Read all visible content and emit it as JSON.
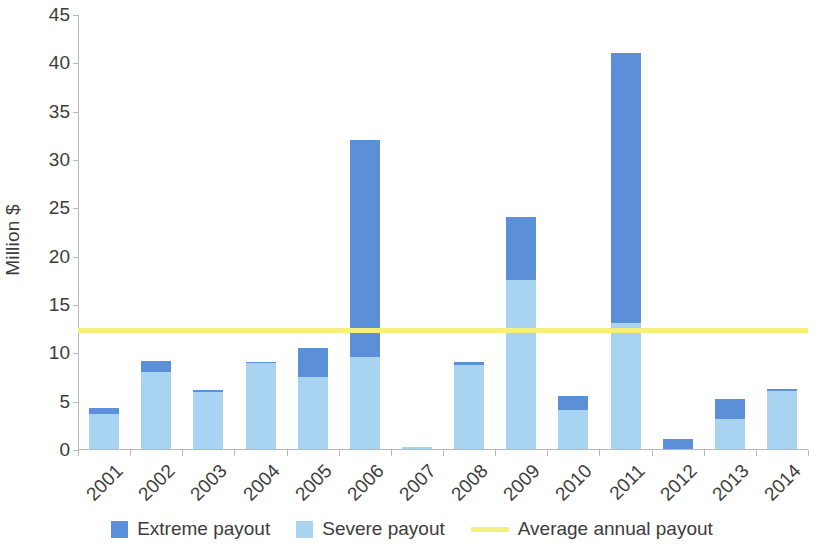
{
  "chart_data": {
    "type": "bar",
    "stacked": true,
    "title": "",
    "xlabel": "",
    "ylabel": "Million $",
    "ylim": [
      0,
      45
    ],
    "ytick_step": 5,
    "yticks": [
      0,
      5,
      10,
      15,
      20,
      25,
      30,
      35,
      40,
      45
    ],
    "grid": false,
    "legend_position": "bottom",
    "categories": [
      "2001",
      "2002",
      "2003",
      "2004",
      "2005",
      "2006",
      "2007",
      "2008",
      "2009",
      "2010",
      "2011",
      "2012",
      "2013",
      "2014"
    ],
    "series": [
      {
        "name": "Severe payout",
        "color": "#a8d4f2",
        "values": [
          3.6,
          8.0,
          5.9,
          8.9,
          7.5,
          9.5,
          0.2,
          8.7,
          17.5,
          4.0,
          13.0,
          0.0,
          3.1,
          6.0
        ]
      },
      {
        "name": "Extreme payout",
        "color": "#5b8fd8",
        "values": [
          0.6,
          1.1,
          0.2,
          0.1,
          3.0,
          22.5,
          0.0,
          0.3,
          6.5,
          1.5,
          28.0,
          1.0,
          2.1,
          0.2
        ]
      }
    ],
    "totals": [
      4.2,
      9.1,
      6.1,
      9.0,
      10.5,
      32.0,
      0.2,
      9.0,
      24.0,
      5.5,
      41.0,
      1.0,
      5.2,
      6.2
    ],
    "reference_line": {
      "name": "Average annual payout",
      "value": 12.4,
      "color": "#f5f07a"
    }
  },
  "legend": {
    "items": [
      {
        "label": "Extreme payout",
        "marker": "square",
        "color": "#5b8fd8"
      },
      {
        "label": "Severe payout",
        "marker": "square",
        "color": "#a8d4f2"
      },
      {
        "label": "Average annual payout",
        "marker": "line",
        "color": "#f5f07a"
      }
    ]
  }
}
